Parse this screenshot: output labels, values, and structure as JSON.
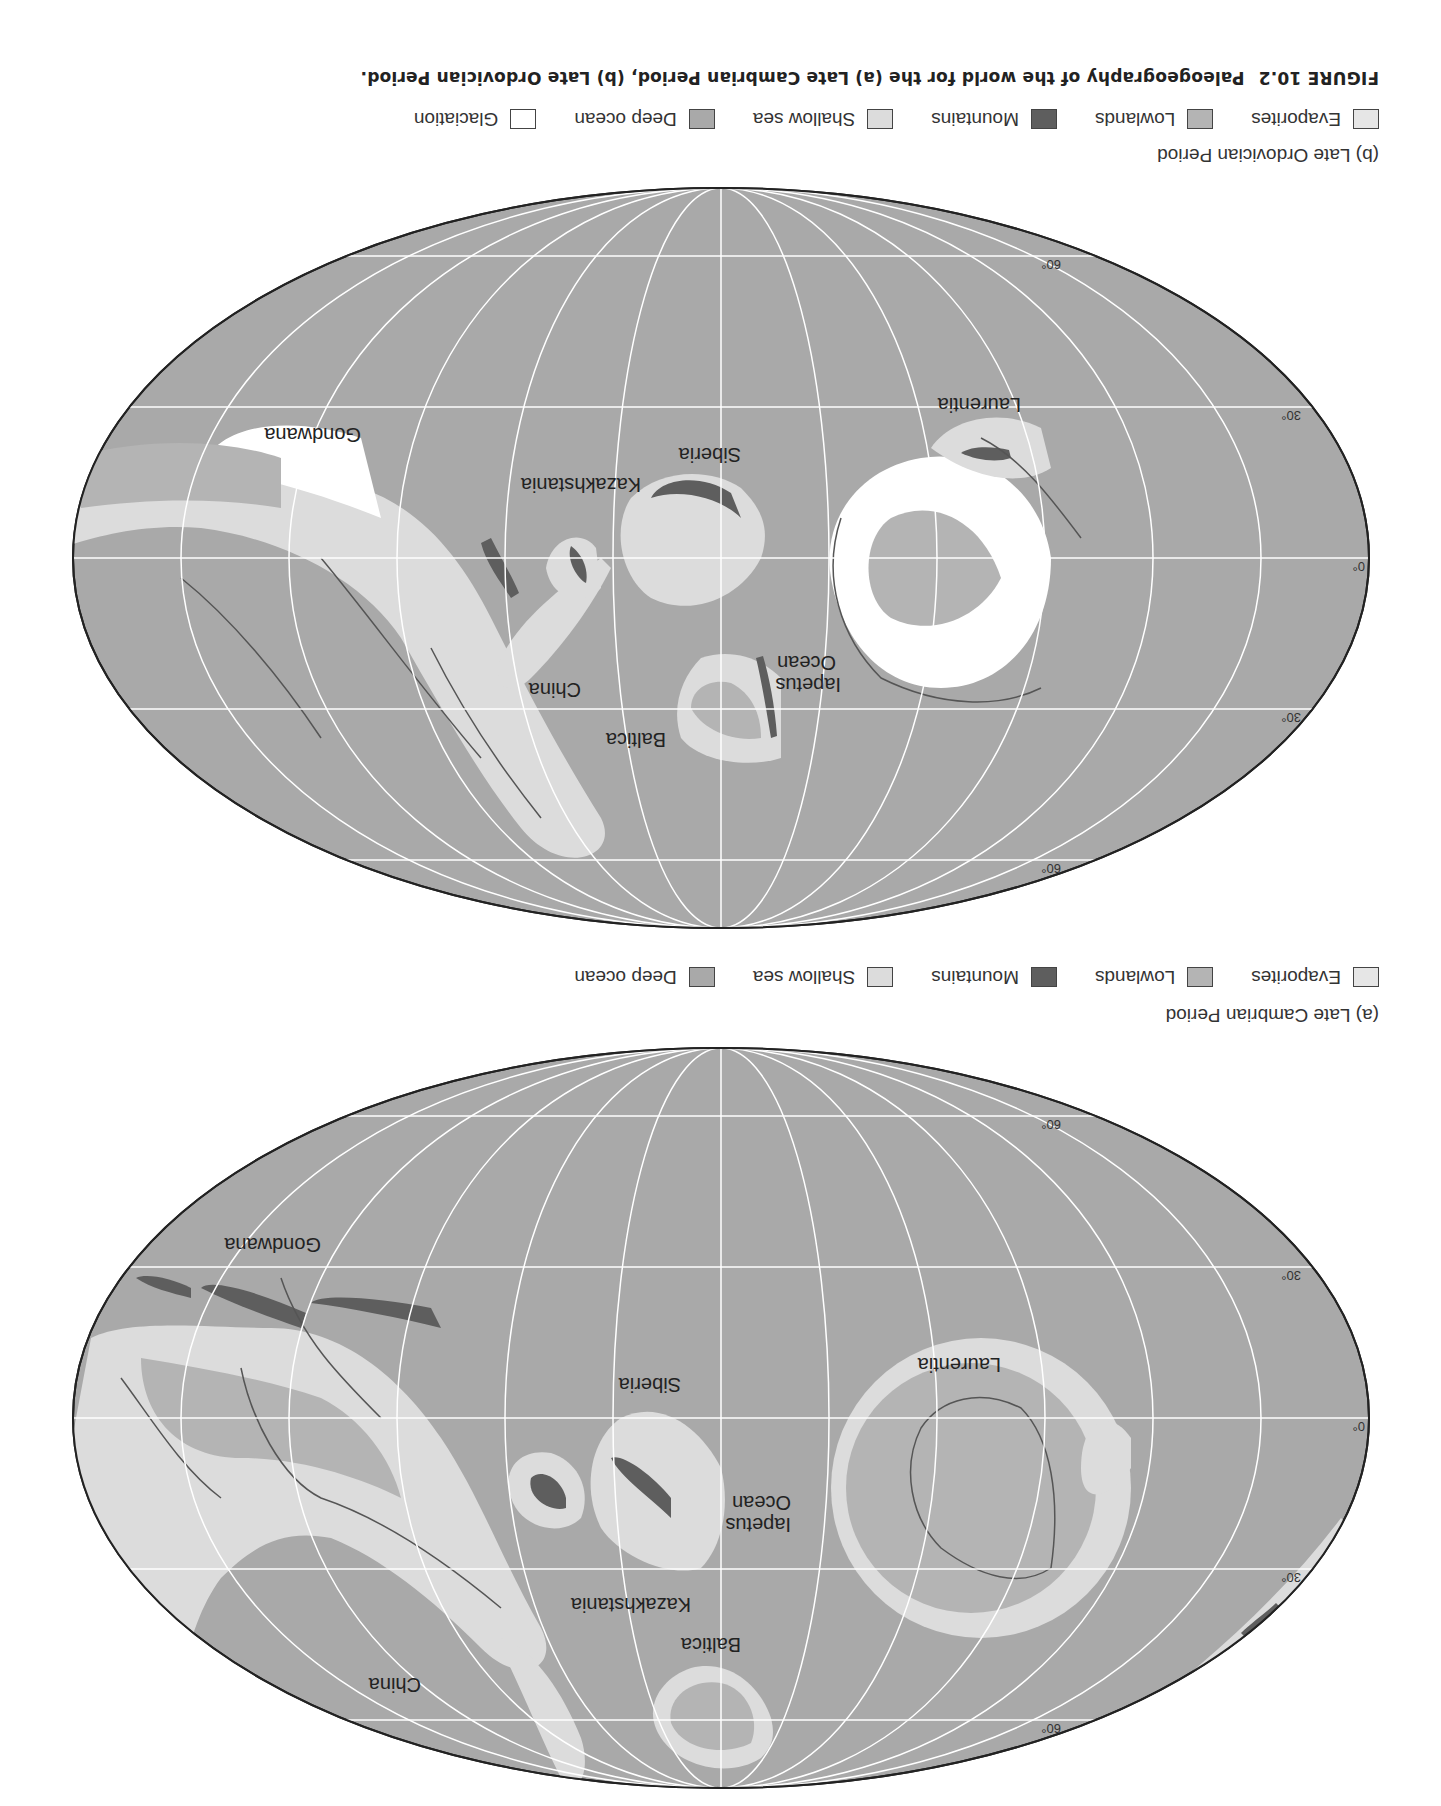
{
  "figure": {
    "number": "FIGURE 10.2",
    "title": "Paleogeography of the world for the (a) Late Cambrian Period, (b) Late Ordovician Period."
  },
  "colors": {
    "evaporites": "#e6e6e6",
    "lowlands": "#b4b4b4",
    "mountains": "#5e5e5e",
    "shallow_sea": "#dcdcdc",
    "deep_ocean": "#a9a9a9",
    "glaciation": "#ffffff",
    "coastline": "#555555",
    "grid": "#ffffff"
  },
  "maps": [
    {
      "id": "a",
      "caption": "(a)  Late Cambrian Period",
      "latitude_labels": [
        "60°",
        "30°",
        "0°",
        "30°",
        "60°"
      ],
      "continent_labels": [
        "Laurentia",
        "Iapetus",
        "Ocean",
        "Siberia",
        "Kazakhstania",
        "Baltica",
        "China",
        "Gondwana"
      ],
      "legend": [
        {
          "key": "evaporites",
          "label": "Evaporites"
        },
        {
          "key": "lowlands",
          "label": "Lowlands"
        },
        {
          "key": "mountains",
          "label": "Mountains"
        },
        {
          "key": "shallow_sea",
          "label": "Shallow sea"
        },
        {
          "key": "deep_ocean",
          "label": "Deep ocean"
        }
      ]
    },
    {
      "id": "b",
      "caption": "(b)  Late Ordovician Period",
      "latitude_labels": [
        "60°",
        "30°",
        "0°",
        "30°",
        "60°"
      ],
      "continent_labels": [
        "Laurentia",
        "Iapetus",
        "Ocean",
        "Siberia",
        "Kazakhstania",
        "Baltica",
        "China",
        "Gondwana"
      ],
      "legend": [
        {
          "key": "evaporites",
          "label": "Evaporites"
        },
        {
          "key": "lowlands",
          "label": "Lowlands"
        },
        {
          "key": "mountains",
          "label": "Mountains"
        },
        {
          "key": "shallow_sea",
          "label": "Shallow sea"
        },
        {
          "key": "deep_ocean",
          "label": "Deep ocean"
        },
        {
          "key": "glaciation",
          "label": "Glaciation"
        }
      ]
    }
  ]
}
